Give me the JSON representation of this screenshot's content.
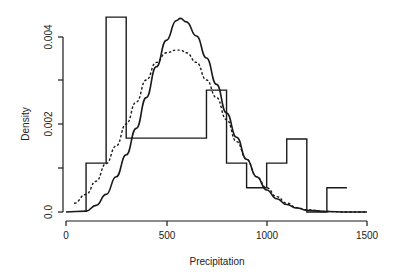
{
  "chart_data": {
    "type": "bar",
    "title": "",
    "xlabel": "Precipitation",
    "ylabel": "Density",
    "xlim": [
      0,
      1500
    ],
    "ylim": [
      0,
      0.0045
    ],
    "x_ticks": [
      0,
      500,
      1000,
      1500
    ],
    "x_tick_labels": [
      "0",
      "500",
      "1000",
      "1500"
    ],
    "y_ticks": [
      0,
      0.001,
      0.002,
      0.003,
      0.004
    ],
    "y_tick_labels": [
      "0.0",
      "",
      "0.002",
      "",
      "0.004"
    ],
    "grid": false,
    "legend": null,
    "histogram": {
      "bin_edges": [
        100,
        200,
        300,
        700,
        800,
        900,
        1000,
        1100,
        1200,
        1300,
        1400
      ],
      "densities": [
        0.00111,
        0.00443,
        0.00168,
        0.00277,
        0.00111,
        0.00055,
        0.00111,
        0.00166,
        0.0,
        0.00055
      ]
    },
    "series": [
      {
        "name": "solid density curve",
        "style": "solid",
        "x": [
          0,
          100,
          150,
          200,
          250,
          300,
          350,
          400,
          450,
          500,
          550,
          570,
          600,
          650,
          700,
          750,
          800,
          850,
          900,
          950,
          1000,
          1050,
          1100,
          1150,
          1200,
          1300,
          1400,
          1500
        ],
        "y": [
          0,
          2e-05,
          0.00015,
          0.0004,
          0.0008,
          0.0013,
          0.0019,
          0.0026,
          0.0033,
          0.0039,
          0.00435,
          0.0044,
          0.00432,
          0.004,
          0.0035,
          0.0029,
          0.00225,
          0.0017,
          0.0012,
          0.0008,
          0.0005,
          0.0003,
          0.00017,
          9e-05,
          4e-05,
          1e-05,
          0.0,
          0.0
        ]
      },
      {
        "name": "dashed density curve",
        "style": "dashed",
        "x": [
          40,
          100,
          150,
          200,
          250,
          300,
          350,
          400,
          450,
          500,
          550,
          570,
          600,
          650,
          700,
          750,
          800,
          850,
          900,
          950,
          1000,
          1050,
          1100,
          1150,
          1200,
          1300,
          1400,
          1500
        ],
        "y": [
          0.0002,
          0.0004,
          0.0007,
          0.0011,
          0.0015,
          0.002,
          0.0025,
          0.003,
          0.0034,
          0.00362,
          0.00368,
          0.00368,
          0.00362,
          0.0034,
          0.003,
          0.0026,
          0.0021,
          0.0016,
          0.0012,
          0.0008,
          0.00055,
          0.00035,
          0.0002,
          0.0001,
          5e-05,
          1e-05,
          0.0,
          0.0
        ]
      }
    ]
  },
  "labels": {
    "xlabel": "Precipitation",
    "ylabel": "Density",
    "x_ticks": [
      "0",
      "500",
      "1000",
      "1500"
    ],
    "y_ticks": [
      "0.0",
      "0.002",
      "0.004"
    ]
  }
}
